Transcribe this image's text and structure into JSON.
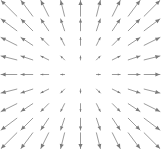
{
  "chart_data": {
    "type": "quiver",
    "title": "",
    "subtitle": "",
    "xlabel": "",
    "ylabel": "",
    "legend": [],
    "annotations": [],
    "grid": false,
    "axes_visible": false,
    "background_color": "#ffffff",
    "arrow_color": "#7a7a7a",
    "grid_cols": 9,
    "grid_rows": 9,
    "xlim": [
      -4,
      4
    ],
    "ylim": [
      -4,
      4
    ],
    "x": [
      -4,
      -3,
      -2,
      -1,
      0,
      1,
      2,
      3,
      4
    ],
    "y": [
      4,
      3,
      2,
      1,
      0,
      -1,
      -2,
      -3,
      -4
    ],
    "vectors": [
      {
        "x": -4,
        "y": 4,
        "u": -4,
        "v": 4
      },
      {
        "x": -3,
        "y": 4,
        "u": -3,
        "v": 4
      },
      {
        "x": -2,
        "y": 4,
        "u": -2,
        "v": 4
      },
      {
        "x": -1,
        "y": 4,
        "u": -1,
        "v": 4
      },
      {
        "x": 0,
        "y": 4,
        "u": 0,
        "v": 4
      },
      {
        "x": 1,
        "y": 4,
        "u": 1,
        "v": 4
      },
      {
        "x": 2,
        "y": 4,
        "u": 2,
        "v": 4
      },
      {
        "x": 3,
        "y": 4,
        "u": 3,
        "v": 4
      },
      {
        "x": 4,
        "y": 4,
        "u": 4,
        "v": 4
      },
      {
        "x": -4,
        "y": 3,
        "u": -4,
        "v": 3
      },
      {
        "x": -3,
        "y": 3,
        "u": -3,
        "v": 3
      },
      {
        "x": -2,
        "y": 3,
        "u": -2,
        "v": 3
      },
      {
        "x": -1,
        "y": 3,
        "u": -1,
        "v": 3
      },
      {
        "x": 0,
        "y": 3,
        "u": 0,
        "v": 3
      },
      {
        "x": 1,
        "y": 3,
        "u": 1,
        "v": 3
      },
      {
        "x": 2,
        "y": 3,
        "u": 2,
        "v": 3
      },
      {
        "x": 3,
        "y": 3,
        "u": 3,
        "v": 3
      },
      {
        "x": 4,
        "y": 3,
        "u": 4,
        "v": 3
      },
      {
        "x": -4,
        "y": 2,
        "u": -4,
        "v": 2
      },
      {
        "x": -3,
        "y": 2,
        "u": -3,
        "v": 2
      },
      {
        "x": -2,
        "y": 2,
        "u": -2,
        "v": 2
      },
      {
        "x": -1,
        "y": 2,
        "u": -1,
        "v": 2
      },
      {
        "x": 0,
        "y": 2,
        "u": 0,
        "v": 2
      },
      {
        "x": 1,
        "y": 2,
        "u": 1,
        "v": 2
      },
      {
        "x": 2,
        "y": 2,
        "u": 2,
        "v": 2
      },
      {
        "x": 3,
        "y": 2,
        "u": 3,
        "v": 2
      },
      {
        "x": 4,
        "y": 2,
        "u": 4,
        "v": 2
      },
      {
        "x": -4,
        "y": 1,
        "u": -4,
        "v": 1
      },
      {
        "x": -3,
        "y": 1,
        "u": -3,
        "v": 1
      },
      {
        "x": -2,
        "y": 1,
        "u": -2,
        "v": 1
      },
      {
        "x": -1,
        "y": 1,
        "u": -1,
        "v": 1
      },
      {
        "x": 0,
        "y": 1,
        "u": 0,
        "v": 1
      },
      {
        "x": 1,
        "y": 1,
        "u": 1,
        "v": 1
      },
      {
        "x": 2,
        "y": 1,
        "u": 2,
        "v": 1
      },
      {
        "x": 3,
        "y": 1,
        "u": 3,
        "v": 1
      },
      {
        "x": 4,
        "y": 1,
        "u": 4,
        "v": 1
      },
      {
        "x": -4,
        "y": 0,
        "u": -4,
        "v": 0
      },
      {
        "x": -3,
        "y": 0,
        "u": -3,
        "v": 0
      },
      {
        "x": -2,
        "y": 0,
        "u": -2,
        "v": 0
      },
      {
        "x": -1,
        "y": 0,
        "u": -1,
        "v": 0
      },
      {
        "x": 0,
        "y": 0,
        "u": 0,
        "v": 0
      },
      {
        "x": 1,
        "y": 0,
        "u": 1,
        "v": 0
      },
      {
        "x": 2,
        "y": 0,
        "u": 2,
        "v": 0
      },
      {
        "x": 3,
        "y": 0,
        "u": 3,
        "v": 0
      },
      {
        "x": 4,
        "y": 0,
        "u": 4,
        "v": 0
      },
      {
        "x": -4,
        "y": -1,
        "u": -4,
        "v": -1
      },
      {
        "x": -3,
        "y": -1,
        "u": -3,
        "v": -1
      },
      {
        "x": -2,
        "y": -1,
        "u": -2,
        "v": -1
      },
      {
        "x": -1,
        "y": -1,
        "u": -1,
        "v": -1
      },
      {
        "x": 0,
        "y": -1,
        "u": 0,
        "v": -1
      },
      {
        "x": 1,
        "y": -1,
        "u": 1,
        "v": -1
      },
      {
        "x": 2,
        "y": -1,
        "u": 2,
        "v": -1
      },
      {
        "x": 3,
        "y": -1,
        "u": 3,
        "v": -1
      },
      {
        "x": 4,
        "y": -1,
        "u": 4,
        "v": -1
      },
      {
        "x": -4,
        "y": -2,
        "u": -4,
        "v": -2
      },
      {
        "x": -3,
        "y": -2,
        "u": -3,
        "v": -2
      },
      {
        "x": -2,
        "y": -2,
        "u": -2,
        "v": -2
      },
      {
        "x": -1,
        "y": -2,
        "u": -1,
        "v": -2
      },
      {
        "x": 0,
        "y": -2,
        "u": 0,
        "v": -2
      },
      {
        "x": 1,
        "y": -2,
        "u": 1,
        "v": -2
      },
      {
        "x": 2,
        "y": -2,
        "u": 2,
        "v": -2
      },
      {
        "x": 3,
        "y": -2,
        "u": 3,
        "v": -2
      },
      {
        "x": 4,
        "y": -2,
        "u": 4,
        "v": -2
      },
      {
        "x": -4,
        "y": -3,
        "u": -4,
        "v": -3
      },
      {
        "x": -3,
        "y": -3,
        "u": -3,
        "v": -3
      },
      {
        "x": -2,
        "y": -3,
        "u": -2,
        "v": -3
      },
      {
        "x": -1,
        "y": -3,
        "u": -1,
        "v": -3
      },
      {
        "x": 0,
        "y": -3,
        "u": 0,
        "v": -3
      },
      {
        "x": 1,
        "y": -3,
        "u": 1,
        "v": -3
      },
      {
        "x": 2,
        "y": -3,
        "u": 2,
        "v": -3
      },
      {
        "x": 3,
        "y": -3,
        "u": 3,
        "v": -3
      },
      {
        "x": 4,
        "y": -3,
        "u": 4,
        "v": -3
      },
      {
        "x": -4,
        "y": -4,
        "u": -4,
        "v": -4
      },
      {
        "x": -3,
        "y": -4,
        "u": -3,
        "v": -4
      },
      {
        "x": -2,
        "y": -4,
        "u": -2,
        "v": -4
      },
      {
        "x": -1,
        "y": -4,
        "u": -1,
        "v": -4
      },
      {
        "x": 0,
        "y": -4,
        "u": 0,
        "v": -4
      },
      {
        "x": 1,
        "y": -4,
        "u": 1,
        "v": -4
      },
      {
        "x": 2,
        "y": -4,
        "u": 2,
        "v": -4
      },
      {
        "x": 3,
        "y": -4,
        "u": 3,
        "v": -4
      },
      {
        "x": 4,
        "y": -4,
        "u": 4,
        "v": -4
      }
    ]
  }
}
